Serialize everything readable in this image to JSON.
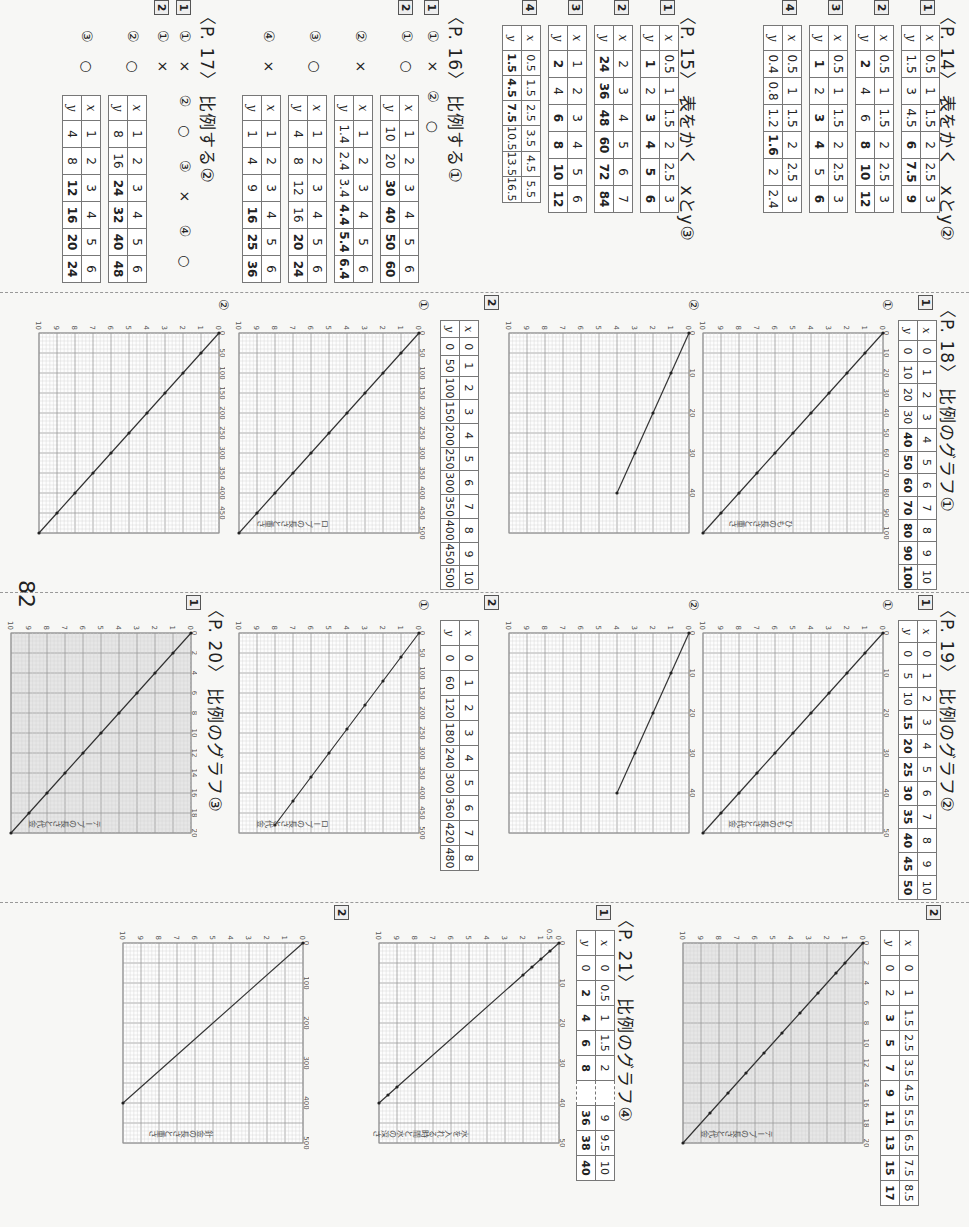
{
  "page_number": "82",
  "p14": {
    "title": "〈P. 14〉 表をかく　xとy②",
    "items": [
      {
        "num": "1",
        "x": [
          "0.5",
          "1",
          "1.5",
          "2",
          "2.5",
          "3"
        ],
        "y": [
          "1.5",
          "3",
          "4.5",
          "6",
          "7.5",
          "9"
        ]
      },
      {
        "num": "2",
        "x": [
          "0.5",
          "1",
          "1.5",
          "2",
          "2.5",
          "3"
        ],
        "y": [
          "2",
          "4",
          "6",
          "8",
          "10",
          "12"
        ]
      },
      {
        "num": "3",
        "x": [
          "0.5",
          "1",
          "1.5",
          "2",
          "2.5",
          "3"
        ],
        "y": [
          "1",
          "2",
          "3",
          "4",
          "5",
          "6"
        ]
      },
      {
        "num": "4",
        "x": [
          "0.5",
          "1",
          "1.5",
          "2",
          "2.5",
          "3"
        ],
        "y": [
          "0.4",
          "0.8",
          "1.2",
          "1.6",
          "2",
          "2.4"
        ]
      }
    ]
  },
  "p15": {
    "title": "〈P. 15〉 表をかく　xとy③",
    "items": [
      {
        "num": "1",
        "x": [
          "0.5",
          "1",
          "1.5",
          "2",
          "2.5",
          "3"
        ],
        "y": [
          "1",
          "2",
          "3",
          "4",
          "5",
          "6"
        ]
      },
      {
        "num": "2",
        "x": [
          "2",
          "3",
          "4",
          "5",
          "6",
          "7"
        ],
        "y": [
          "24",
          "36",
          "48",
          "60",
          "72",
          "84"
        ]
      },
      {
        "num": "3",
        "x": [
          "1",
          "2",
          "3",
          "4",
          "5",
          "6"
        ],
        "y": [
          "2",
          "4",
          "6",
          "8",
          "10",
          "12"
        ]
      },
      {
        "num": "4",
        "x": [
          "0.5",
          "1.5",
          "2.5",
          "3.5",
          "4.5",
          "5.5"
        ],
        "y": [
          "1.5",
          "4.5",
          "7.5",
          "10.5",
          "13.5",
          "16.5"
        ]
      }
    ]
  },
  "p16": {
    "title": "〈P. 16〉 比例する①",
    "q1": {
      "num": "1",
      "answers": [
        {
          "label": "①",
          "mark": "×"
        },
        {
          "label": "②",
          "mark": "○"
        }
      ]
    },
    "q2": {
      "num": "2",
      "items": [
        {
          "label": "①",
          "mark": "○",
          "x": [
            "1",
            "2",
            "3",
            "4",
            "5",
            "6"
          ],
          "y": [
            "10",
            "20",
            "30",
            "40",
            "50",
            "60"
          ]
        },
        {
          "label": "②",
          "mark": "×",
          "x": [
            "1",
            "2",
            "3",
            "4",
            "5",
            "6"
          ],
          "y": [
            "1.4",
            "2.4",
            "3.4",
            "4.4",
            "5.4",
            "6.4"
          ]
        },
        {
          "label": "③",
          "mark": "○",
          "x": [
            "1",
            "2",
            "3",
            "4",
            "5",
            "6"
          ],
          "y": [
            "4",
            "8",
            "12",
            "16",
            "20",
            "24"
          ]
        },
        {
          "label": "④",
          "mark": "×",
          "x": [
            "1",
            "2",
            "3",
            "4",
            "5",
            "6"
          ],
          "y": [
            "1",
            "4",
            "9",
            "16",
            "25",
            "36"
          ]
        }
      ]
    }
  },
  "p17": {
    "title": "〈P. 17〉 比例する②",
    "q1": {
      "num": "1",
      "answers": [
        {
          "label": "①",
          "mark": "×"
        },
        {
          "label": "②",
          "mark": "○"
        },
        {
          "label": "③",
          "mark": "×"
        },
        {
          "label": "④",
          "mark": "○"
        }
      ]
    },
    "q2": {
      "num": "2",
      "items": [
        {
          "label": "①",
          "mark": "×"
        },
        {
          "label": "②",
          "mark": "○",
          "x": [
            "1",
            "2",
            "3",
            "4",
            "5",
            "6"
          ],
          "y": [
            "8",
            "16",
            "24",
            "32",
            "40",
            "48"
          ]
        },
        {
          "label": "③",
          "mark": "○",
          "x": [
            "1",
            "2",
            "3",
            "4",
            "5",
            "6"
          ],
          "y": [
            "4",
            "8",
            "12",
            "16",
            "20",
            "24"
          ]
        }
      ]
    }
  },
  "p18": {
    "title": "〈P. 18〉 比例のグラフ①",
    "q1": {
      "num": "1",
      "x": [
        "0",
        "1",
        "2",
        "3",
        "4",
        "5",
        "6",
        "7",
        "8",
        "9",
        "10"
      ],
      "y": [
        "0",
        "10",
        "20",
        "30",
        "40",
        "50",
        "60",
        "70",
        "80",
        "90",
        "100"
      ],
      "graph1_label": "①",
      "graph2_label": "②"
    },
    "q2": {
      "num": "2",
      "x": [
        "0",
        "1",
        "2",
        "3",
        "4",
        "5",
        "6",
        "7",
        "8",
        "9",
        "10"
      ],
      "y": [
        "0",
        "50",
        "100",
        "150",
        "200",
        "250",
        "300",
        "350",
        "400",
        "450",
        "500"
      ],
      "graph1_label": "①",
      "graph2_label": "②"
    }
  },
  "p19": {
    "title": "〈P. 19〉 比例のグラフ②",
    "q1": {
      "num": "1",
      "x": [
        "0",
        "1",
        "2",
        "3",
        "4",
        "5",
        "6",
        "7",
        "8",
        "9",
        "10"
      ],
      "y": [
        "0",
        "5",
        "10",
        "15",
        "20",
        "25",
        "30",
        "35",
        "40",
        "45",
        "50"
      ],
      "graph1_label": "①",
      "graph2_label": "②"
    },
    "q2": {
      "num": "2",
      "x": [
        "0",
        "1",
        "2",
        "3",
        "4",
        "5",
        "6",
        "7",
        "8"
      ],
      "y": [
        "0",
        "60",
        "120",
        "180",
        "240",
        "300",
        "360",
        "420",
        "480"
      ],
      "graph1_label": "①"
    }
  },
  "p20": {
    "title": "〈P. 20〉 比例のグラフ③",
    "q1": {
      "num": "1"
    },
    "q2": {
      "num": "2",
      "x": [
        "0",
        "1",
        "1.5",
        "2.5",
        "3.5",
        "4.5",
        "5.5",
        "6.5",
        "7.5",
        "8.5"
      ],
      "y": [
        "0",
        "2",
        "3",
        "5",
        "7",
        "9",
        "11",
        "13",
        "15",
        "17"
      ]
    }
  },
  "p21": {
    "title": "〈P. 21〉 比例のグラフ④",
    "q1": {
      "num": "1",
      "x": [
        "0",
        "0.5",
        "1",
        "1.5",
        "2",
        "",
        "9",
        "9.5",
        "10"
      ],
      "y": [
        "0",
        "2",
        "4",
        "6",
        "8",
        "",
        "36",
        "38",
        "40"
      ]
    },
    "q2": {
      "num": "2"
    }
  },
  "chart_data": [
    {
      "id": "p18-1-1",
      "type": "line",
      "title": "ひもの長さと重さ",
      "xlabel": "x (m)",
      "ylabel": "y (g)",
      "x": [
        0,
        1,
        2,
        3,
        4,
        5,
        6,
        7,
        8,
        9,
        10
      ],
      "values": [
        0,
        10,
        20,
        30,
        40,
        50,
        60,
        70,
        80,
        90,
        100
      ],
      "xlim": [
        0,
        10
      ],
      "ylim": [
        0,
        100
      ],
      "y_ticks": [
        0,
        10,
        20,
        30,
        40,
        50,
        60,
        70,
        80,
        90,
        100
      ],
      "grid": true
    },
    {
      "id": "p18-1-2",
      "type": "line",
      "title": "",
      "xlabel": "x (m)",
      "ylabel": "y (g)",
      "x": [
        0,
        1,
        2,
        3,
        4
      ],
      "values": [
        0,
        10,
        20,
        30,
        40
      ],
      "xlim": [
        0,
        10
      ],
      "ylim": [
        0,
        50
      ],
      "y_ticks": [
        0,
        10,
        20,
        30,
        40
      ],
      "grid": true
    },
    {
      "id": "p18-2-1",
      "type": "line",
      "title": "ロープの長さと重さ",
      "xlabel": "x (m)",
      "ylabel": "y (g)",
      "x": [
        0,
        1,
        2,
        3,
        4,
        5,
        6,
        7,
        8,
        9,
        10
      ],
      "values": [
        0,
        50,
        100,
        150,
        200,
        250,
        300,
        350,
        400,
        450,
        500
      ],
      "xlim": [
        0,
        10
      ],
      "ylim": [
        0,
        500
      ],
      "y_ticks": [
        0,
        50,
        100,
        150,
        200,
        250,
        300,
        350,
        400,
        450,
        500
      ],
      "grid": true
    },
    {
      "id": "p18-2-2",
      "type": "line",
      "title": "",
      "xlabel": "x (m)",
      "ylabel": "y (g)",
      "x": [
        0,
        1,
        2,
        3,
        4,
        5,
        6,
        7,
        8,
        9,
        10
      ],
      "values": [
        0,
        50,
        100,
        150,
        200,
        250,
        300,
        350,
        400,
        450,
        500
      ],
      "xlim": [
        0,
        10
      ],
      "ylim": [
        0,
        500
      ],
      "y_ticks": [
        0,
        50,
        100,
        150,
        200,
        250,
        300,
        350,
        400,
        450
      ],
      "grid": true
    },
    {
      "id": "p19-1-1",
      "type": "line",
      "title": "ひもの長さと代金",
      "xlabel": "x (m)",
      "ylabel": "y (円)",
      "x": [
        0,
        1,
        2,
        3,
        4,
        5,
        6,
        7,
        8,
        9,
        10
      ],
      "values": [
        0,
        5,
        10,
        15,
        20,
        25,
        30,
        35,
        40,
        45,
        50
      ],
      "xlim": [
        0,
        10
      ],
      "ylim": [
        0,
        50
      ],
      "y_ticks": [
        0,
        10,
        20,
        30,
        40,
        50
      ],
      "grid": true
    },
    {
      "id": "p19-2-1",
      "type": "line",
      "title": "ロープの長さと代金",
      "xlabel": "x (m)",
      "ylabel": "y (円)",
      "x": [
        0,
        1,
        2,
        3,
        4,
        5,
        6,
        7,
        8
      ],
      "values": [
        0,
        60,
        120,
        180,
        240,
        300,
        360,
        420,
        480
      ],
      "xlim": [
        0,
        10
      ],
      "ylim": [
        0,
        500
      ],
      "y_ticks": [
        0,
        50,
        100,
        150,
        200,
        250,
        300,
        350,
        400,
        450,
        500
      ],
      "grid": true
    },
    {
      "id": "p20-1",
      "type": "line",
      "title": "テープの長さと代金",
      "xlabel": "x (m)",
      "ylabel": "y (円)",
      "x": [
        0,
        1,
        2,
        3,
        4,
        5,
        6,
        7,
        8,
        9,
        10
      ],
      "values": [
        0,
        2,
        4,
        6,
        8,
        10,
        12,
        14,
        16,
        18,
        20
      ],
      "xlim": [
        0,
        10
      ],
      "ylim": [
        0,
        20
      ],
      "y_ticks": [
        0,
        2,
        4,
        6,
        8,
        10,
        12,
        14,
        16,
        18,
        20
      ],
      "grid": true
    },
    {
      "id": "p20-2",
      "type": "line",
      "title": "テープの長さと代金",
      "xlabel": "x (m)",
      "ylabel": "y (円)",
      "x": [
        0,
        1,
        1.5,
        2.5,
        3.5,
        4.5,
        5.5,
        6.5,
        7.5,
        8.5,
        10
      ],
      "values": [
        0,
        2,
        3,
        5,
        7,
        9,
        11,
        13,
        15,
        17,
        20
      ],
      "xlim": [
        0,
        10
      ],
      "ylim": [
        0,
        20
      ],
      "y_ticks": [
        0,
        2,
        4,
        6,
        8,
        10,
        12,
        14,
        16,
        18,
        20
      ],
      "grid": true
    },
    {
      "id": "p21-1",
      "type": "line",
      "title": "水を入れる時間と水の深さ",
      "xlabel": "x (分)",
      "ylabel": "y (cm)",
      "x": [
        0,
        0.5,
        1,
        1.5,
        2,
        9,
        9.5,
        10
      ],
      "values": [
        0,
        2,
        4,
        6,
        8,
        36,
        38,
        40
      ],
      "xlim": [
        0,
        10
      ],
      "ylim": [
        0,
        50
      ],
      "x_ticks": [
        0,
        0.5,
        1,
        2,
        3,
        4,
        5,
        6,
        7,
        8,
        9,
        10
      ],
      "y_ticks": [
        0,
        10,
        20,
        30,
        40,
        50
      ],
      "grid": true
    },
    {
      "id": "p21-2",
      "type": "line",
      "title": "針金の長さと重さ",
      "xlabel": "x (m)",
      "ylabel": "y (g)",
      "x": [
        0,
        10
      ],
      "values": [
        0,
        400
      ],
      "xlim": [
        0,
        10
      ],
      "ylim": [
        0,
        500
      ],
      "y_ticks": [
        0,
        100,
        200,
        300,
        400,
        500
      ],
      "grid": true
    }
  ]
}
